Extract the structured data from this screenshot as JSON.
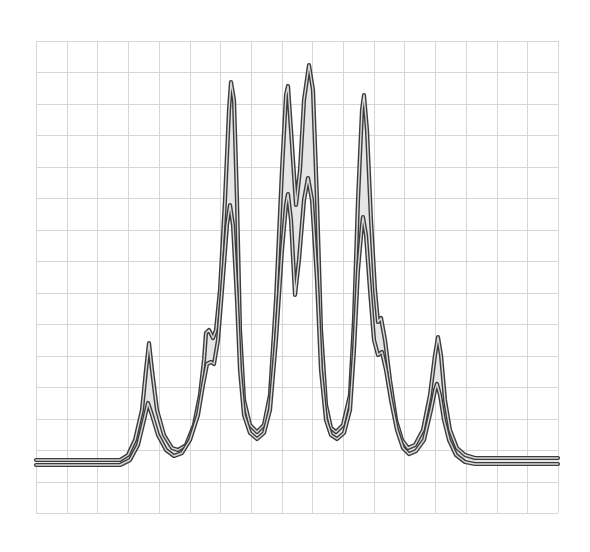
{
  "chart_data": {
    "type": "line",
    "title": "",
    "xlabel": "",
    "ylabel": "",
    "grid": true,
    "legend": null,
    "plot_area_px": {
      "left": 36,
      "top": 41,
      "right": 558,
      "bottom": 513
    },
    "grid_divisions": {
      "columns": 17,
      "rows": 15
    },
    "x_unit": "grid columns (0-17)",
    "y_unit": "grid rows above bottom (0-15)",
    "series": [
      {
        "name": "outer",
        "points_px": [
          [
            36,
            460
          ],
          [
            120,
            460
          ],
          [
            128,
            455
          ],
          [
            135,
            440
          ],
          [
            142,
            410
          ],
          [
            146,
            370
          ],
          [
            149,
            343
          ],
          [
            152,
            370
          ],
          [
            157,
            410
          ],
          [
            164,
            435
          ],
          [
            172,
            448
          ],
          [
            178,
            450
          ],
          [
            186,
            445
          ],
          [
            194,
            425
          ],
          [
            200,
            395
          ],
          [
            204,
            360
          ],
          [
            206,
            333
          ],
          [
            209,
            330
          ],
          [
            213,
            338
          ],
          [
            216,
            330
          ],
          [
            220,
            290
          ],
          [
            225,
            200
          ],
          [
            229,
            110
          ],
          [
            231,
            82
          ],
          [
            234,
            100
          ],
          [
            237,
            200
          ],
          [
            240,
            330
          ],
          [
            244,
            400
          ],
          [
            250,
            425
          ],
          [
            257,
            432
          ],
          [
            264,
            425
          ],
          [
            270,
            395
          ],
          [
            276,
            300
          ],
          [
            282,
            170
          ],
          [
            286,
            95
          ],
          [
            288,
            86
          ],
          [
            291,
            130
          ],
          [
            296,
            205
          ],
          [
            300,
            170
          ],
          [
            304,
            100
          ],
          [
            309,
            65
          ],
          [
            313,
            90
          ],
          [
            317,
            200
          ],
          [
            321,
            330
          ],
          [
            326,
            405
          ],
          [
            331,
            428
          ],
          [
            336,
            432
          ],
          [
            343,
            425
          ],
          [
            350,
            395
          ],
          [
            354,
            320
          ],
          [
            358,
            200
          ],
          [
            362,
            110
          ],
          [
            364,
            95
          ],
          [
            367,
            130
          ],
          [
            371,
            220
          ],
          [
            375,
            290
          ],
          [
            378,
            322
          ],
          [
            381,
            318
          ],
          [
            385,
            340
          ],
          [
            390,
            380
          ],
          [
            396,
            420
          ],
          [
            402,
            440
          ],
          [
            408,
            448
          ],
          [
            415,
            445
          ],
          [
            423,
            430
          ],
          [
            430,
            395
          ],
          [
            435,
            355
          ],
          [
            438,
            337
          ],
          [
            441,
            355
          ],
          [
            445,
            400
          ],
          [
            450,
            430
          ],
          [
            457,
            448
          ],
          [
            465,
            455
          ],
          [
            475,
            458
          ],
          [
            558,
            458
          ]
        ]
      },
      {
        "name": "inner",
        "points_px": [
          [
            36,
            465
          ],
          [
            120,
            465
          ],
          [
            130,
            460
          ],
          [
            138,
            445
          ],
          [
            144,
            420
          ],
          [
            148,
            403
          ],
          [
            152,
            415
          ],
          [
            158,
            435
          ],
          [
            166,
            450
          ],
          [
            174,
            456
          ],
          [
            182,
            453
          ],
          [
            190,
            440
          ],
          [
            198,
            415
          ],
          [
            203,
            385
          ],
          [
            207,
            364
          ],
          [
            211,
            362
          ],
          [
            214,
            364
          ],
          [
            218,
            340
          ],
          [
            222,
            290
          ],
          [
            227,
            225
          ],
          [
            230,
            205
          ],
          [
            233,
            225
          ],
          [
            237,
            300
          ],
          [
            240,
            370
          ],
          [
            244,
            415
          ],
          [
            250,
            433
          ],
          [
            257,
            439
          ],
          [
            264,
            433
          ],
          [
            270,
            410
          ],
          [
            276,
            340
          ],
          [
            282,
            250
          ],
          [
            286,
            205
          ],
          [
            288,
            194
          ],
          [
            291,
            220
          ],
          [
            295,
            295
          ],
          [
            299,
            260
          ],
          [
            304,
            200
          ],
          [
            308,
            178
          ],
          [
            312,
            200
          ],
          [
            317,
            280
          ],
          [
            321,
            370
          ],
          [
            326,
            420
          ],
          [
            331,
            435
          ],
          [
            337,
            439
          ],
          [
            344,
            433
          ],
          [
            350,
            410
          ],
          [
            354,
            350
          ],
          [
            358,
            270
          ],
          [
            362,
            225
          ],
          [
            363,
            217
          ],
          [
            366,
            235
          ],
          [
            370,
            290
          ],
          [
            374,
            340
          ],
          [
            378,
            355
          ],
          [
            382,
            352
          ],
          [
            386,
            370
          ],
          [
            391,
            400
          ],
          [
            397,
            430
          ],
          [
            403,
            448
          ],
          [
            409,
            454
          ],
          [
            416,
            451
          ],
          [
            424,
            440
          ],
          [
            431,
            410
          ],
          [
            435,
            390
          ],
          [
            437,
            384
          ],
          [
            440,
            395
          ],
          [
            444,
            420
          ],
          [
            449,
            440
          ],
          [
            456,
            455
          ],
          [
            465,
            462
          ],
          [
            475,
            464
          ],
          [
            558,
            464
          ]
        ]
      }
    ],
    "peaks": [
      {
        "id": 1,
        "x_grid": 3.7,
        "outer_y_grid": 5.3,
        "inner_y_grid": 3.5
      },
      {
        "id": "shoulder-left",
        "x_grid": 5.6,
        "outer_y_grid": 5.8,
        "inner_y_grid": 4.8
      },
      {
        "id": 2,
        "x_grid": 6.4,
        "outer_y_grid": 13.7,
        "inner_y_grid": 9.9
      },
      {
        "id": 3,
        "x_grid": 8.2,
        "outer_y_grid": 13.6,
        "inner_y_grid": 10.1
      },
      {
        "id": 4,
        "x_grid": 8.9,
        "outer_y_grid": 14.3,
        "inner_y_grid": 10.7
      },
      {
        "id": 5,
        "x_grid": 10.7,
        "outer_y_grid": 13.3,
        "inner_y_grid": 9.4
      },
      {
        "id": "shoulder-right",
        "x_grid": 11.2,
        "outer_y_grid": 6.2,
        "inner_y_grid": 5.1
      },
      {
        "id": 6,
        "x_grid": 13.1,
        "outer_y_grid": 5.6,
        "inner_y_grid": 4.2
      }
    ],
    "baseline_y_grid": 1.7
  },
  "colors": {
    "background": "#ffffff",
    "grid": "#d6d6d6",
    "curve_stroke": "#3c3c3c",
    "band_fill": "#e6e6e6"
  }
}
